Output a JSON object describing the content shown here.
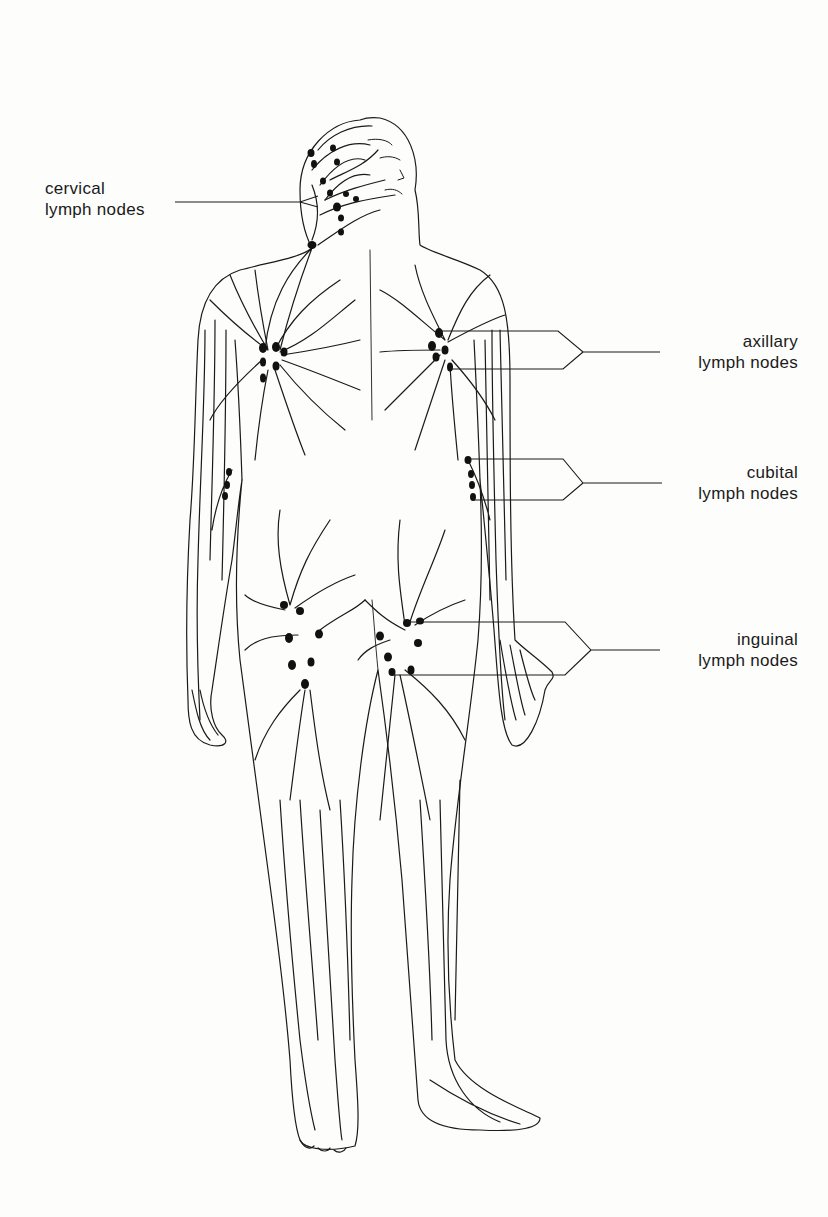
{
  "diagram": {
    "colors": {
      "background": "#fdfdfc",
      "line": "#1a1a1a",
      "node": "#111111"
    },
    "labels": [
      {
        "id": "cervical",
        "line1": "cervical",
        "line2": "lymph nodes",
        "side": "left"
      },
      {
        "id": "axillary",
        "line1": "axillary",
        "line2": "lymph nodes",
        "side": "right"
      },
      {
        "id": "cubital",
        "line1": "cubital",
        "line2": "lymph nodes",
        "side": "right"
      },
      {
        "id": "inguinal",
        "line1": "inguinal",
        "line2": "lymph nodes",
        "side": "right"
      }
    ]
  }
}
